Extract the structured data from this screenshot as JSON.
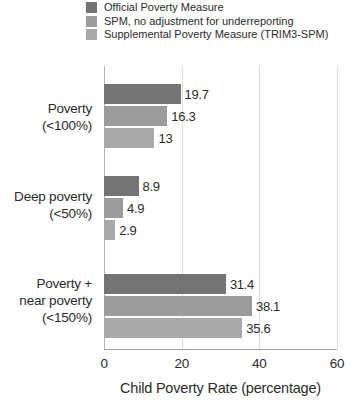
{
  "colors": {
    "official": "#747474",
    "spm_unadjusted": "#9c9c9c",
    "trim3_spm": "#a9a9a9",
    "text": "#2b2b2b",
    "axis_line": "#9f9f9f",
    "gridline": "#dcdcdc",
    "zero_line": "#b5b5b5"
  },
  "chart_data": {
    "type": "bar",
    "orientation": "horizontal",
    "title": "",
    "xlabel": "Child Poverty Rate (percentage)",
    "ylabel": "",
    "xlim": [
      0,
      60
    ],
    "xticks": [
      "0",
      "20",
      "40",
      "60"
    ],
    "grid": true,
    "legend_position": "top",
    "categories": [
      "Poverty (<100%)",
      "Deep poverty (<50%)",
      "Poverty + near poverty (<150%)"
    ],
    "category_label_lines": [
      [
        "Poverty",
        "(<100%)"
      ],
      [
        "Deep poverty",
        "(<50%)"
      ],
      [
        "Poverty +",
        "near poverty",
        "(<150%)"
      ]
    ],
    "series": [
      {
        "name": "Official Poverty Measure",
        "color": "#747474",
        "values": [
          19.7,
          8.9,
          31.4
        ],
        "value_labels": [
          "19.7",
          "8.9",
          "31.4"
        ]
      },
      {
        "name": "SPM, no adjustment for underreporting",
        "color": "#9c9c9c",
        "values": [
          16.3,
          4.9,
          38.1
        ],
        "value_labels": [
          "16.3",
          "4.9",
          "38.1"
        ]
      },
      {
        "name": "Supplemental Poverty Measure (TRIM3-SPM)",
        "color": "#a9a9a9",
        "values": [
          13,
          2.9,
          35.6
        ],
        "value_labels": [
          "13",
          "2.9",
          "35.6"
        ]
      }
    ]
  }
}
